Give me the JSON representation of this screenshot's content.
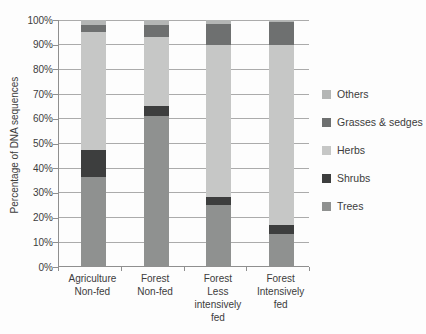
{
  "chart_data": {
    "type": "bar",
    "stacked": true,
    "units": "percent",
    "title": "",
    "ylabel": "Percentage of DNA sequences",
    "ylim": [
      0,
      100
    ],
    "ytick_step": 10,
    "ytick_suffix": "%",
    "grid": true,
    "categories": [
      {
        "id": "agriculture-non-fed",
        "lines": [
          "Agriculture",
          "Non-fed"
        ]
      },
      {
        "id": "forest-non-fed",
        "lines": [
          "Forest",
          "Non-fed"
        ]
      },
      {
        "id": "forest-less-intensively-fed",
        "lines": [
          "Forest",
          "Less",
          "intensively",
          "fed"
        ]
      },
      {
        "id": "forest-intensively-fed",
        "lines": [
          "Forest",
          "Intensively",
          "fed"
        ]
      }
    ],
    "series": [
      {
        "name": "Trees",
        "color": "#8f9190",
        "values": [
          36,
          61,
          25,
          13
        ]
      },
      {
        "name": "Shrubs",
        "color": "#3d3e3e",
        "values": [
          11,
          4,
          3,
          3.5
        ]
      },
      {
        "name": "Herbs",
        "color": "#c6c7c6",
        "values": [
          48,
          28,
          62,
          73.5
        ]
      },
      {
        "name": "Grasses & sedges",
        "color": "#6e7070",
        "values": [
          3,
          5,
          8.5,
          9
        ]
      },
      {
        "name": "Others",
        "color": "#b4b6b5",
        "values": [
          2,
          2,
          1.5,
          1
        ]
      }
    ],
    "legend": {
      "position": "right",
      "order": [
        "Others",
        "Grasses & sedges",
        "Herbs",
        "Shrubs",
        "Trees"
      ]
    }
  }
}
